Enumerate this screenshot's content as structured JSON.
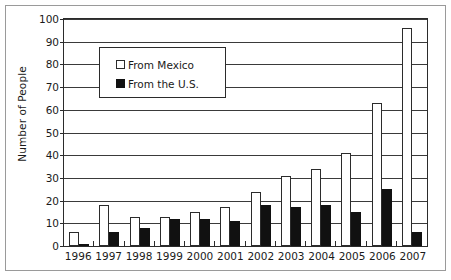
{
  "chart_data": {
    "type": "bar",
    "title": "",
    "xlabel": "",
    "ylabel": "Number of People",
    "ylim": [
      0,
      100
    ],
    "ytick_step": 10,
    "yticks": [
      0,
      10,
      20,
      30,
      40,
      50,
      60,
      70,
      80,
      90,
      100
    ],
    "grid": true,
    "legend_position": "upper-left-inside",
    "categories": [
      "1996",
      "1997",
      "1998",
      "1999",
      "2000",
      "2001",
      "2002",
      "2003",
      "2004",
      "2005",
      "2006",
      "2007"
    ],
    "series": [
      {
        "name": "From Mexico",
        "pattern": "dotted",
        "color": "#ffffff",
        "edge_color": "#2b2b2b",
        "values": [
          6,
          18,
          13,
          13,
          15,
          17,
          24,
          31,
          34,
          41,
          63,
          96
        ]
      },
      {
        "name": "From the U.S.",
        "pattern": "solid",
        "color": "#111111",
        "edge_color": "#111111",
        "values": [
          1,
          6,
          8,
          12,
          12,
          11,
          18,
          17,
          18,
          15,
          25,
          6
        ]
      }
    ]
  }
}
